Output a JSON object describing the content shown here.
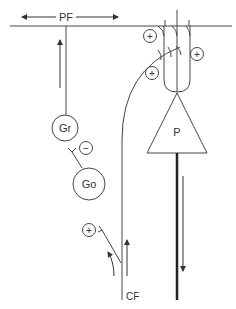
{
  "diagram": {
    "colors": {
      "line": "#444444",
      "background": "#ffffff"
    },
    "labels": {
      "parallel_fiber": "PF",
      "purkinje": "P",
      "granule": "Gr",
      "golgi": "Go",
      "climbing_fiber": "CF"
    },
    "synapse_signs": {
      "excitatory": "+",
      "inhibitory": "−"
    },
    "nodes": [
      {
        "id": "granule-cell",
        "label": "Gr"
      },
      {
        "id": "golgi-cell",
        "label": "Go"
      },
      {
        "id": "purkinje-cell",
        "label": "P"
      }
    ],
    "fibers": [
      {
        "id": "parallel-fiber",
        "label": "PF",
        "direction": "bidirectional-horizontal"
      },
      {
        "id": "climbing-fiber",
        "label": "CF",
        "direction": "up"
      },
      {
        "id": "purkinje-axon",
        "direction": "down"
      }
    ]
  }
}
